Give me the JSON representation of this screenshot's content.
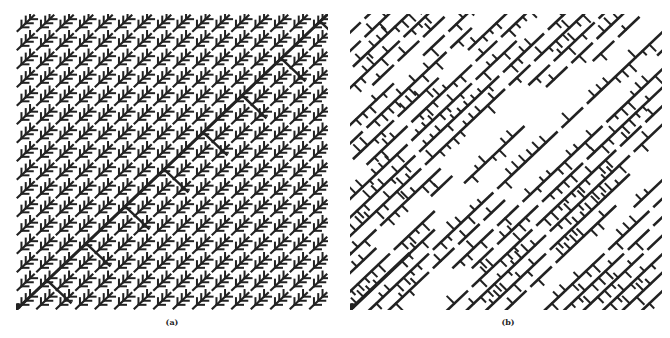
{
  "figure": {
    "panels": [
      {
        "id": "a",
        "caption": "(a)",
        "x": 16,
        "y": 14,
        "size": 312,
        "grid": 16,
        "pattern": "regular",
        "ink": "#222222"
      },
      {
        "id": "b",
        "caption": "(b)",
        "x": 350,
        "y": 14,
        "size": 312,
        "grid": 16,
        "pattern": "irregular",
        "ink": "#222222"
      }
    ],
    "root_dot": {
      "radius": 3,
      "color": "#222222"
    }
  }
}
